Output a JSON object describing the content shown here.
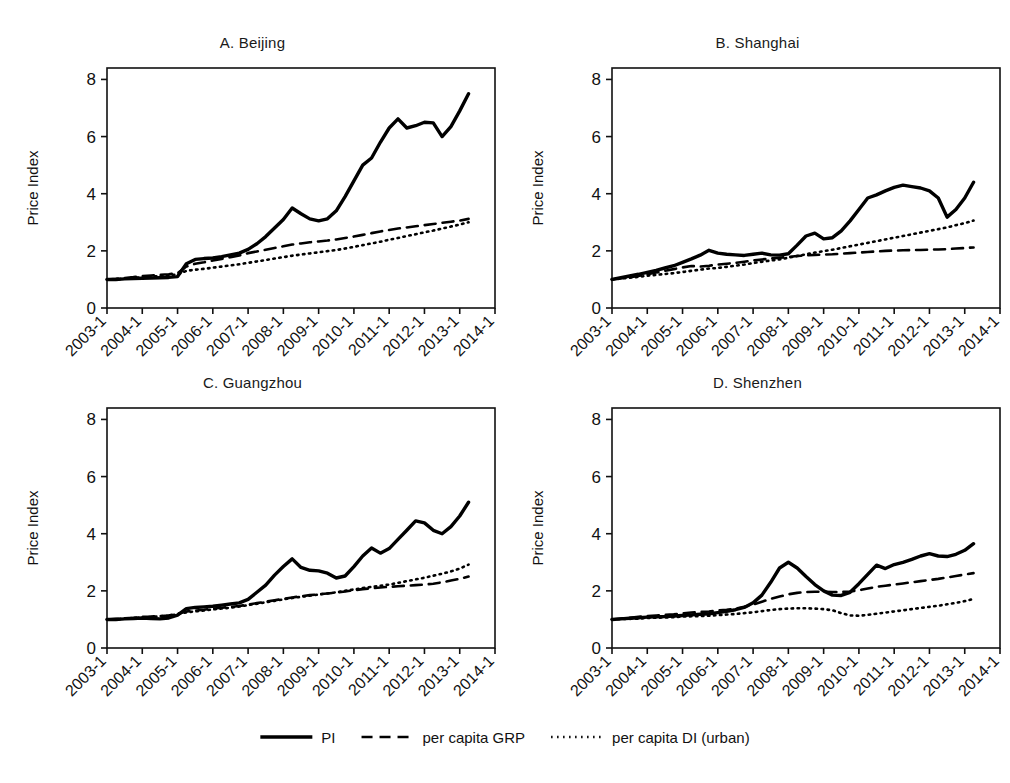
{
  "figure": {
    "ylabel": "Price Index",
    "y_ticks": [
      "0",
      "2",
      "4",
      "6",
      "8"
    ],
    "x_ticks": [
      "2003-1",
      "2004-1",
      "2005-1",
      "2006-1",
      "2007-1",
      "2008-1",
      "2009-1",
      "2010-1",
      "2011-1",
      "2012-1",
      "2013-1",
      "2014-1"
    ],
    "line_color": "#000000"
  },
  "legend": {
    "items": [
      {
        "label": "PI",
        "style": "solid"
      },
      {
        "label": "per capita GRP",
        "style": "dashed"
      },
      {
        "label": "per capita DI (urban)",
        "style": "dotted"
      }
    ]
  },
  "chart_data": [
    {
      "type": "line",
      "title": "A. Beijing",
      "panel": "A",
      "xlabel": "",
      "ylabel": "Price Index",
      "ylim": [
        0,
        8.4
      ],
      "xlim": [
        2003.0,
        2014.0
      ],
      "y_ticks": [
        0,
        2,
        4,
        6,
        8
      ],
      "x_ticks": [
        2003,
        2004,
        2005,
        2006,
        2007,
        2008,
        2009,
        2010,
        2011,
        2012,
        2013,
        2014
      ],
      "x_tick_labels": [
        "2003-1",
        "2004-1",
        "2005-1",
        "2006-1",
        "2007-1",
        "2008-1",
        "2009-1",
        "2010-1",
        "2011-1",
        "2012-1",
        "2013-1",
        "2014-1"
      ],
      "grid": false,
      "legend_position": "bottom-figure",
      "x": [
        2003.0,
        2003.25,
        2003.5,
        2003.75,
        2004.0,
        2004.25,
        2004.5,
        2004.75,
        2005.0,
        2005.25,
        2005.5,
        2005.75,
        2006.0,
        2006.25,
        2006.5,
        2006.75,
        2007.0,
        2007.25,
        2007.5,
        2007.75,
        2008.0,
        2008.25,
        2008.5,
        2008.75,
        2009.0,
        2009.25,
        2009.5,
        2009.75,
        2010.0,
        2010.25,
        2010.5,
        2010.75,
        2011.0,
        2011.25,
        2011.5,
        2011.75,
        2012.0,
        2012.25,
        2012.5,
        2012.75,
        2013.0,
        2013.25
      ],
      "series": [
        {
          "name": "PI",
          "style": "solid",
          "values": [
            1.0,
            1.0,
            1.02,
            1.03,
            1.04,
            1.05,
            1.06,
            1.07,
            1.1,
            1.55,
            1.7,
            1.73,
            1.75,
            1.8,
            1.86,
            1.92,
            2.05,
            2.25,
            2.5,
            2.8,
            3.1,
            3.5,
            3.3,
            3.12,
            3.05,
            3.12,
            3.4,
            3.9,
            4.45,
            5.0,
            5.25,
            5.8,
            6.3,
            6.62,
            6.3,
            6.38,
            6.5,
            6.48,
            6.0,
            6.35,
            6.9,
            7.5
          ]
        },
        {
          "name": "per capita GRP",
          "style": "dashed",
          "values": [
            1.0,
            1.02,
            1.05,
            1.08,
            1.12,
            1.14,
            1.16,
            1.18,
            1.22,
            1.45,
            1.55,
            1.6,
            1.66,
            1.72,
            1.78,
            1.84,
            1.92,
            1.98,
            2.04,
            2.1,
            2.16,
            2.22,
            2.26,
            2.3,
            2.33,
            2.36,
            2.4,
            2.45,
            2.5,
            2.56,
            2.62,
            2.68,
            2.73,
            2.78,
            2.82,
            2.86,
            2.9,
            2.94,
            2.98,
            3.02,
            3.06,
            3.12
          ]
        },
        {
          "name": "per capita DI (urban)",
          "style": "dotted",
          "values": [
            1.0,
            1.01,
            1.03,
            1.05,
            1.08,
            1.1,
            1.12,
            1.14,
            1.18,
            1.3,
            1.34,
            1.37,
            1.41,
            1.45,
            1.49,
            1.53,
            1.58,
            1.63,
            1.68,
            1.73,
            1.78,
            1.83,
            1.87,
            1.91,
            1.95,
            1.99,
            2.03,
            2.08,
            2.14,
            2.2,
            2.26,
            2.32,
            2.39,
            2.45,
            2.52,
            2.58,
            2.65,
            2.71,
            2.78,
            2.85,
            2.92,
            3.0
          ]
        }
      ]
    },
    {
      "type": "line",
      "title": "B. Shanghai",
      "panel": "B",
      "xlabel": "",
      "ylabel": "Price Index",
      "ylim": [
        0,
        8.4
      ],
      "xlim": [
        2003.0,
        2014.0
      ],
      "y_ticks": [
        0,
        2,
        4,
        6,
        8
      ],
      "x_ticks": [
        2003,
        2004,
        2005,
        2006,
        2007,
        2008,
        2009,
        2010,
        2011,
        2012,
        2013,
        2014
      ],
      "x_tick_labels": [
        "2003-1",
        "2004-1",
        "2005-1",
        "2006-1",
        "2007-1",
        "2008-1",
        "2009-1",
        "2010-1",
        "2011-1",
        "2012-1",
        "2013-1",
        "2014-1"
      ],
      "grid": false,
      "legend_position": "bottom-figure",
      "x": [
        2003.0,
        2003.25,
        2003.5,
        2003.75,
        2004.0,
        2004.25,
        2004.5,
        2004.75,
        2005.0,
        2005.25,
        2005.5,
        2005.75,
        2006.0,
        2006.25,
        2006.5,
        2006.75,
        2007.0,
        2007.25,
        2007.5,
        2007.75,
        2008.0,
        2008.25,
        2008.5,
        2008.75,
        2009.0,
        2009.25,
        2009.5,
        2009.75,
        2010.0,
        2010.25,
        2010.5,
        2010.75,
        2011.0,
        2011.25,
        2011.5,
        2011.75,
        2012.0,
        2012.25,
        2012.5,
        2012.75,
        2013.0,
        2013.25
      ],
      "series": [
        {
          "name": "PI",
          "style": "solid",
          "values": [
            1.0,
            1.06,
            1.12,
            1.18,
            1.25,
            1.32,
            1.4,
            1.48,
            1.6,
            1.72,
            1.85,
            2.02,
            1.92,
            1.88,
            1.86,
            1.84,
            1.88,
            1.92,
            1.86,
            1.85,
            1.9,
            2.2,
            2.52,
            2.62,
            2.42,
            2.46,
            2.7,
            3.05,
            3.45,
            3.85,
            3.96,
            4.1,
            4.22,
            4.3,
            4.25,
            4.2,
            4.1,
            3.85,
            3.18,
            3.45,
            3.85,
            4.4
          ]
        },
        {
          "name": "per capita GRP",
          "style": "dashed",
          "values": [
            1.0,
            1.04,
            1.08,
            1.12,
            1.18,
            1.24,
            1.3,
            1.36,
            1.42,
            1.47,
            1.45,
            1.48,
            1.52,
            1.55,
            1.58,
            1.62,
            1.66,
            1.7,
            1.73,
            1.76,
            1.79,
            1.82,
            1.84,
            1.86,
            1.87,
            1.88,
            1.9,
            1.92,
            1.94,
            1.96,
            1.98,
            2.0,
            2.01,
            2.02,
            2.03,
            2.03,
            2.04,
            2.05,
            2.06,
            2.08,
            2.1,
            2.12
          ]
        },
        {
          "name": "per capita DI (urban)",
          "style": "dotted",
          "values": [
            1.0,
            1.03,
            1.06,
            1.09,
            1.13,
            1.16,
            1.19,
            1.22,
            1.26,
            1.3,
            1.34,
            1.38,
            1.4,
            1.44,
            1.48,
            1.52,
            1.57,
            1.62,
            1.66,
            1.7,
            1.76,
            1.82,
            1.88,
            1.94,
            1.99,
            2.04,
            2.1,
            2.16,
            2.22,
            2.28,
            2.34,
            2.4,
            2.46,
            2.52,
            2.58,
            2.64,
            2.7,
            2.76,
            2.82,
            2.9,
            2.97,
            3.06
          ]
        }
      ]
    },
    {
      "type": "line",
      "title": "C. Guangzhou",
      "panel": "C",
      "xlabel": "",
      "ylabel": "Price Index",
      "ylim": [
        0,
        8.4
      ],
      "xlim": [
        2003.0,
        2014.0
      ],
      "y_ticks": [
        0,
        2,
        4,
        6,
        8
      ],
      "x_ticks": [
        2003,
        2004,
        2005,
        2006,
        2007,
        2008,
        2009,
        2010,
        2011,
        2012,
        2013,
        2014
      ],
      "x_tick_labels": [
        "2003-1",
        "2004-1",
        "2005-1",
        "2006-1",
        "2007-1",
        "2008-1",
        "2009-1",
        "2010-1",
        "2011-1",
        "2012-1",
        "2013-1",
        "2014-1"
      ],
      "grid": false,
      "legend_position": "bottom-figure",
      "x": [
        2003.0,
        2003.25,
        2003.5,
        2003.75,
        2004.0,
        2004.25,
        2004.5,
        2004.75,
        2005.0,
        2005.25,
        2005.5,
        2005.75,
        2006.0,
        2006.25,
        2006.5,
        2006.75,
        2007.0,
        2007.25,
        2007.5,
        2007.75,
        2008.0,
        2008.25,
        2008.5,
        2008.75,
        2009.0,
        2009.25,
        2009.5,
        2009.75,
        2010.0,
        2010.25,
        2010.5,
        2010.75,
        2011.0,
        2011.25,
        2011.5,
        2011.75,
        2012.0,
        2012.25,
        2012.5,
        2012.75,
        2013.0,
        2013.25
      ],
      "series": [
        {
          "name": "PI",
          "style": "solid",
          "values": [
            1.0,
            1.0,
            1.02,
            1.03,
            1.05,
            1.03,
            1.02,
            1.05,
            1.15,
            1.38,
            1.42,
            1.44,
            1.46,
            1.5,
            1.54,
            1.58,
            1.7,
            1.95,
            2.2,
            2.55,
            2.85,
            3.12,
            2.82,
            2.72,
            2.7,
            2.62,
            2.45,
            2.52,
            2.85,
            3.22,
            3.5,
            3.32,
            3.48,
            3.8,
            4.12,
            4.45,
            4.38,
            4.12,
            4.0,
            4.25,
            4.62,
            5.1
          ]
        },
        {
          "name": "per capita GRP",
          "style": "dashed",
          "values": [
            1.0,
            1.02,
            1.04,
            1.06,
            1.09,
            1.1,
            1.12,
            1.14,
            1.2,
            1.28,
            1.31,
            1.34,
            1.38,
            1.41,
            1.44,
            1.47,
            1.52,
            1.57,
            1.62,
            1.67,
            1.72,
            1.77,
            1.81,
            1.85,
            1.88,
            1.91,
            1.94,
            1.98,
            2.02,
            2.06,
            2.09,
            2.12,
            2.14,
            2.16,
            2.18,
            2.2,
            2.22,
            2.25,
            2.3,
            2.36,
            2.42,
            2.5
          ]
        },
        {
          "name": "per capita DI (urban)",
          "style": "dotted",
          "values": [
            1.0,
            1.01,
            1.03,
            1.05,
            1.07,
            1.09,
            1.11,
            1.13,
            1.18,
            1.25,
            1.28,
            1.31,
            1.35,
            1.38,
            1.41,
            1.45,
            1.5,
            1.55,
            1.6,
            1.65,
            1.7,
            1.75,
            1.79,
            1.83,
            1.87,
            1.91,
            1.95,
            2.0,
            2.05,
            2.1,
            2.14,
            2.18,
            2.22,
            2.28,
            2.34,
            2.4,
            2.46,
            2.53,
            2.6,
            2.68,
            2.78,
            2.92
          ]
        }
      ]
    },
    {
      "type": "line",
      "title": "D. Shenzhen",
      "panel": "D",
      "xlabel": "",
      "ylabel": "Price Index",
      "ylim": [
        0,
        8.4
      ],
      "xlim": [
        2003.0,
        2014.0
      ],
      "y_ticks": [
        0,
        2,
        4,
        6,
        8
      ],
      "x_ticks": [
        2003,
        2004,
        2005,
        2006,
        2007,
        2008,
        2009,
        2010,
        2011,
        2012,
        2013,
        2014
      ],
      "x_tick_labels": [
        "2003-1",
        "2004-1",
        "2005-1",
        "2006-1",
        "2007-1",
        "2008-1",
        "2009-1",
        "2010-1",
        "2011-1",
        "2012-1",
        "2013-1",
        "2014-1"
      ],
      "grid": false,
      "legend_position": "bottom-figure",
      "x": [
        2003.0,
        2003.25,
        2003.5,
        2003.75,
        2004.0,
        2004.25,
        2004.5,
        2004.75,
        2005.0,
        2005.25,
        2005.5,
        2005.75,
        2006.0,
        2006.25,
        2006.5,
        2006.75,
        2007.0,
        2007.25,
        2007.5,
        2007.75,
        2008.0,
        2008.25,
        2008.5,
        2008.75,
        2009.0,
        2009.25,
        2009.5,
        2009.75,
        2010.0,
        2010.25,
        2010.5,
        2010.75,
        2011.0,
        2011.25,
        2011.5,
        2011.75,
        2012.0,
        2012.25,
        2012.5,
        2012.75,
        2013.0,
        2013.25
      ],
      "series": [
        {
          "name": "PI",
          "style": "solid",
          "values": [
            1.0,
            1.02,
            1.04,
            1.06,
            1.08,
            1.09,
            1.1,
            1.12,
            1.14,
            1.16,
            1.18,
            1.2,
            1.24,
            1.28,
            1.34,
            1.42,
            1.58,
            1.85,
            2.3,
            2.8,
            3.0,
            2.8,
            2.5,
            2.22,
            2.0,
            1.85,
            1.84,
            1.95,
            2.25,
            2.58,
            2.9,
            2.78,
            2.92,
            3.0,
            3.1,
            3.22,
            3.3,
            3.22,
            3.2,
            3.28,
            3.42,
            3.65
          ]
        },
        {
          "name": "per capita GRP",
          "style": "dashed",
          "values": [
            1.0,
            1.03,
            1.06,
            1.09,
            1.12,
            1.14,
            1.16,
            1.18,
            1.21,
            1.24,
            1.26,
            1.28,
            1.31,
            1.34,
            1.38,
            1.44,
            1.52,
            1.62,
            1.72,
            1.8,
            1.88,
            1.93,
            1.96,
            1.97,
            1.97,
            1.96,
            1.96,
            1.98,
            2.02,
            2.08,
            2.14,
            2.18,
            2.22,
            2.26,
            2.3,
            2.34,
            2.38,
            2.42,
            2.47,
            2.52,
            2.57,
            2.62
          ]
        },
        {
          "name": "per capita DI (urban)",
          "style": "dotted",
          "values": [
            1.0,
            1.01,
            1.02,
            1.03,
            1.05,
            1.06,
            1.07,
            1.08,
            1.1,
            1.11,
            1.12,
            1.13,
            1.15,
            1.17,
            1.19,
            1.22,
            1.25,
            1.29,
            1.33,
            1.36,
            1.38,
            1.39,
            1.39,
            1.38,
            1.36,
            1.32,
            1.22,
            1.14,
            1.13,
            1.16,
            1.2,
            1.24,
            1.28,
            1.32,
            1.36,
            1.4,
            1.44,
            1.48,
            1.53,
            1.58,
            1.64,
            1.72
          ]
        }
      ]
    }
  ]
}
